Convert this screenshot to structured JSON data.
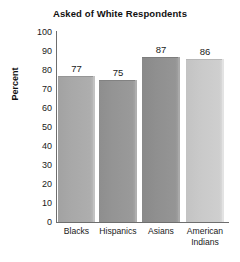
{
  "chart_data": {
    "type": "bar",
    "title": "Asked of White Respondents",
    "xlabel": "",
    "ylabel": "Percent",
    "categories": [
      "Blacks",
      "Hispanics",
      "Asians",
      "American Indians"
    ],
    "values": [
      77,
      75,
      87,
      86
    ],
    "value_labels": [
      "77",
      "75",
      "87",
      "86"
    ],
    "ylim": [
      0,
      100
    ],
    "yticks": [
      100,
      90,
      80,
      70,
      60,
      50,
      40,
      30,
      20,
      10,
      0
    ],
    "ytick_labels": [
      "100",
      "90",
      "80",
      "70",
      "60",
      "50",
      "40",
      "30",
      "20",
      "10",
      "0"
    ],
    "grid": false,
    "legend": "none",
    "bar_colors": [
      "#a8a8a8",
      "#949494",
      "#8f8f8f",
      "#c9c9c9"
    ],
    "axis_color": "#6e6e6e",
    "background": "#ffffff"
  },
  "category_lines": [
    {
      "line1": "Blacks",
      "line2": ""
    },
    {
      "line1": "Hispanics",
      "line2": ""
    },
    {
      "line1": "Asians",
      "line2": ""
    },
    {
      "line1": "American",
      "line2": "Indians"
    }
  ]
}
